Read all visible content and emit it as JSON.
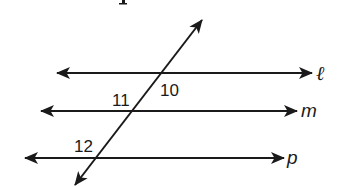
{
  "figure": {
    "type": "parallel-lines-cut-by-transversal",
    "stroke_color": "#1a1a1a",
    "background": "#ffffff",
    "lines": [
      {
        "id": "l",
        "label": "ℓ",
        "y": 73,
        "x1": 57,
        "x2": 312
      },
      {
        "id": "m",
        "label": "m",
        "y": 111,
        "x1": 41,
        "x2": 297
      },
      {
        "id": "p",
        "label": "p",
        "y": 158,
        "x1": 25,
        "x2": 284
      }
    ],
    "transversal": {
      "x1": 75,
      "y1": 185,
      "x2": 202,
      "y2": 20
    },
    "angles": [
      {
        "label": "10",
        "x": 160,
        "y": 96
      },
      {
        "label": "11",
        "x": 112,
        "y": 106
      },
      {
        "label": "12",
        "x": 74,
        "y": 152
      }
    ]
  }
}
